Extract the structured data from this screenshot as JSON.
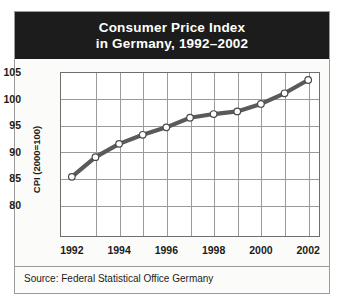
{
  "title": {
    "line1": "Consumer Price Index",
    "line2": "in Germany, 1992–2002"
  },
  "source": "Source: Federal Statistical Office Germany",
  "chart_data": {
    "type": "line",
    "title": "Consumer Price Index in Germany, 1992–2002",
    "xlabel": "",
    "ylabel": "CPI (2000=100)",
    "x": [
      1992,
      1993,
      1994,
      1995,
      1996,
      1997,
      1998,
      1999,
      2000,
      2001,
      2002
    ],
    "values": [
      85.3,
      89.0,
      91.5,
      93.2,
      94.6,
      96.4,
      97.1,
      97.6,
      99.0,
      101.0,
      103.5
    ],
    "xlim": [
      1991.5,
      2002.5
    ],
    "ylim": [
      74.0,
      105.0
    ],
    "yticks": [
      80,
      85,
      90,
      95,
      100,
      105
    ],
    "xticks": [
      1992,
      1994,
      1996,
      1998,
      2000,
      2002
    ],
    "xtick_labels": [
      "1992",
      "1994",
      "1996",
      "1998",
      "2000",
      "2002"
    ],
    "ytick_labels": [
      "80",
      "85",
      "90",
      "95",
      "100",
      "105"
    ],
    "grid": true,
    "legend": null,
    "series_color": "#5a5a5a",
    "marker": "circle-open-white",
    "marker_face": "#ffffff",
    "marker_edge": "#4a4a4a"
  },
  "colors": {
    "banner_bg": "#1c1c1c",
    "banner_text": "#ffffff",
    "frame_border": "#9b9b99",
    "grid": "#9a9a9a",
    "axis": "#6e6e6e",
    "page_bg": "#fbfbfa"
  }
}
